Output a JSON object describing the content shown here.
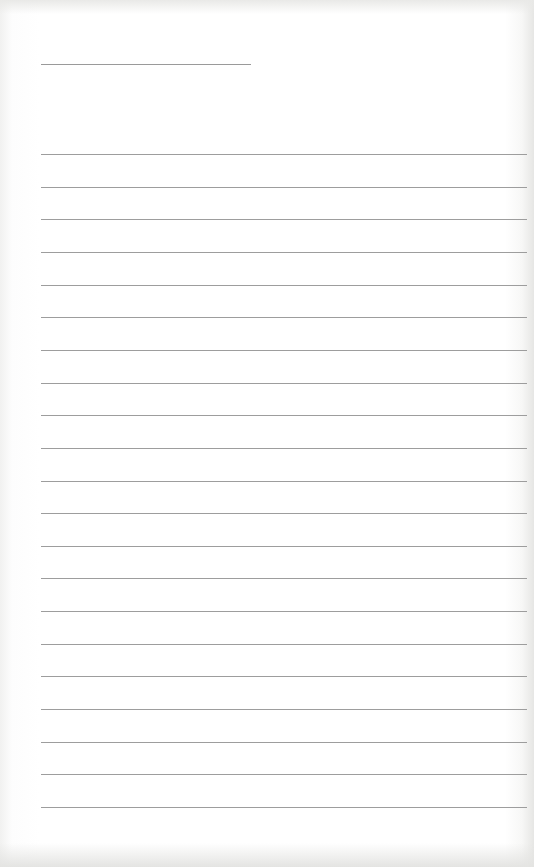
{
  "document": {
    "type": "blank ruled notebook page",
    "header_line": {
      "x_start": 41,
      "x_end": 251,
      "y": 64
    },
    "ruled_lines": {
      "count": 21,
      "first_y": 154,
      "spacing": 32.65,
      "x_start": 41,
      "x_end": 527,
      "color": "#9d9d9d"
    },
    "text": []
  }
}
